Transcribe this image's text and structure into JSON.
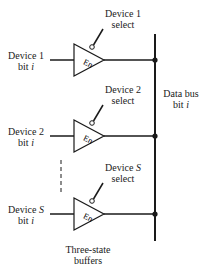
{
  "diagram": {
    "buffers": [
      {
        "input_label_line1": "Device 1",
        "input_label_line2_prefix": "bit ",
        "input_label_var": "i",
        "select_line1": "Device 1",
        "select_line2": "select",
        "enable": "En"
      },
      {
        "input_label_line1": "Device 2",
        "input_label_line2_prefix": "bit ",
        "input_label_var": "i",
        "select_line1": "Device 2",
        "select_line2": "select",
        "enable": "En"
      },
      {
        "input_label_line1_prefix": "Device ",
        "input_label_line1_var": "S",
        "input_label_line2_prefix": "bit ",
        "input_label_var": "i",
        "select_line1_prefix": "Device ",
        "select_line1_var": "S",
        "select_line2": "select",
        "enable": "En"
      }
    ],
    "bus_label_line1": "Data bus",
    "bus_label_line2_prefix": "bit ",
    "bus_label_var": "i",
    "caption_line1": "Three-state",
    "caption_line2": "buffers",
    "colors": {
      "stroke": "#1a1a1a",
      "background": "#ffffff"
    }
  }
}
